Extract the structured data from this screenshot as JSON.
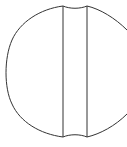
{
  "diagram": {
    "stroke_color": "#333333",
    "background": "#ffffff",
    "circle": {
      "cx": 67,
      "cy": 72,
      "r": 67
    },
    "band": {
      "left_x": 63,
      "right_x": 87,
      "top_y": 6,
      "bottom_y": 137
    }
  }
}
